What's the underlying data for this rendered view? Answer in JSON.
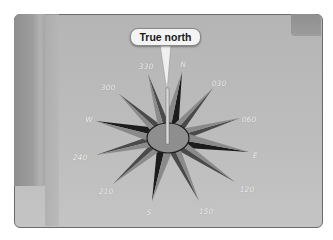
{
  "callout": {
    "label": "True north"
  },
  "center": {
    "x": 168,
    "y": 138
  },
  "colors": {
    "panel_bg": "#bcbcbc",
    "hub_fill": "#8e8e8e",
    "hub_stroke": "#1e1e1e",
    "point_dark": "#1c1c1c",
    "point_mid": "#4a4a4a",
    "point_light": "#8a8a8a",
    "label": "#f2f2f2",
    "needle": "#d8d8d8"
  },
  "labels": [
    {
      "text": "N",
      "x": 183,
      "y": 64
    },
    {
      "text": "030",
      "x": 219,
      "y": 83
    },
    {
      "text": "060",
      "x": 249,
      "y": 119
    },
    {
      "text": "E",
      "x": 255,
      "y": 155
    },
    {
      "text": "120",
      "x": 247,
      "y": 189
    },
    {
      "text": "150",
      "x": 206,
      "y": 211
    },
    {
      "text": "S",
      "x": 149,
      "y": 212
    },
    {
      "text": "210",
      "x": 106,
      "y": 191
    },
    {
      "text": "240",
      "x": 80,
      "y": 157
    },
    {
      "text": "W",
      "x": 89,
      "y": 119
    },
    {
      "text": "300",
      "x": 108,
      "y": 87
    },
    {
      "text": "330",
      "x": 146,
      "y": 66
    }
  ],
  "points": [
    {
      "name": "N",
      "tip": [
        182,
        72
      ],
      "len_type": "cardinal"
    },
    {
      "name": "030",
      "tip": [
        213,
        88
      ],
      "len_type": "minor"
    },
    {
      "name": "060",
      "tip": [
        240,
        118
      ],
      "len_type": "minor"
    },
    {
      "name": "E",
      "tip": [
        249,
        152
      ],
      "len_type": "cardinal"
    },
    {
      "name": "120",
      "tip": [
        235,
        182
      ],
      "len_type": "minor"
    },
    {
      "name": "150",
      "tip": [
        199,
        201
      ],
      "len_type": "minor"
    },
    {
      "name": "S",
      "tip": [
        152,
        201
      ],
      "len_type": "cardinal"
    },
    {
      "name": "210",
      "tip": [
        113,
        184
      ],
      "len_type": "minor"
    },
    {
      "name": "240",
      "tip": [
        96,
        155
      ],
      "len_type": "minor"
    },
    {
      "name": "W",
      "tip": [
        96,
        121
      ],
      "len_type": "cardinal"
    },
    {
      "name": "300",
      "tip": [
        119,
        94
      ],
      "len_type": "minor"
    },
    {
      "name": "330",
      "tip": [
        148,
        74
      ],
      "len_type": "minor"
    }
  ]
}
